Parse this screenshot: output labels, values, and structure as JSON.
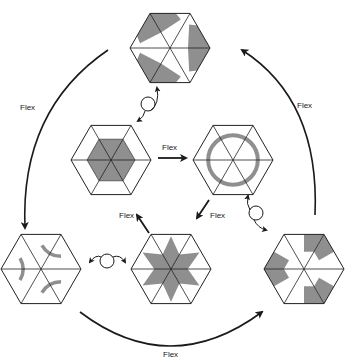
{
  "diagram": {
    "colors": {
      "line": "#222222",
      "shade": "#8f8f8f",
      "arrow": "#1a1a1a",
      "background": "#ffffff"
    },
    "faces": [
      {
        "id": "top",
        "pattern": "chevrons",
        "description": "Three gray chevrons around center"
      },
      {
        "id": "middle-left",
        "pattern": "inner-hexagon",
        "description": "Gray filled inner hexagon"
      },
      {
        "id": "middle-right",
        "pattern": "ring",
        "description": "Gray ring circle"
      },
      {
        "id": "bottom-left",
        "pattern": "arcs",
        "description": "Three gray arcs at alternate corners"
      },
      {
        "id": "bottom-center",
        "pattern": "star",
        "description": "Gray six-pointed star"
      },
      {
        "id": "bottom-right",
        "pattern": "bands",
        "description": "Gray wedge bands"
      }
    ],
    "labels": {
      "top_left_arc": "Flex",
      "top_right_arc": "Flex",
      "bottom_arc": "Flex",
      "inner_top": "Flex",
      "inner_left": "Flex",
      "inner_right": "Flex"
    },
    "transitions": [
      {
        "from": "top",
        "to": "bottom-left",
        "label": "Flex",
        "kind": "long-arc"
      },
      {
        "from": "bottom-left",
        "to": "bottom-right",
        "label": "Flex",
        "kind": "long-arc"
      },
      {
        "from": "bottom-right",
        "to": "top",
        "label": "Flex",
        "kind": "long-arc"
      },
      {
        "from": "middle-left",
        "to": "middle-right",
        "label": "Flex",
        "kind": "short-arrow"
      },
      {
        "from": "middle-right",
        "to": "bottom-center",
        "label": "Flex",
        "kind": "short-arrow"
      },
      {
        "from": "bottom-center",
        "to": "middle-left",
        "label": "Flex",
        "kind": "short-arrow"
      },
      {
        "from": "middle-left",
        "to": "top",
        "label": "",
        "kind": "turn-over"
      },
      {
        "from": "middle-right",
        "to": "bottom-right",
        "label": "",
        "kind": "turn-over"
      },
      {
        "from": "bottom-center",
        "to": "bottom-left",
        "label": "",
        "kind": "turn-over"
      }
    ]
  }
}
